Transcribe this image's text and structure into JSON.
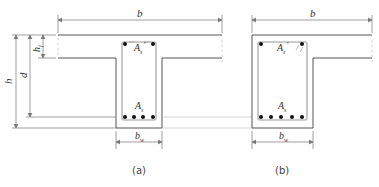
{
  "figure": {
    "colors": {
      "outline": "#555555",
      "stirrup": "#bbbbbb",
      "dimension": "#777777",
      "bar": "#111111"
    },
    "panels": [
      {
        "id": "a",
        "caption": "(a)",
        "shape": "T-beam",
        "labels": {
          "flange_width": "b",
          "web_width": "b",
          "web_width_sub": "w",
          "compression_steel": "A",
          "compression_steel_sub": "s",
          "compression_steel_prime": "'",
          "tension_steel": "A",
          "tension_steel_sub": "s"
        },
        "compression_bars": 2,
        "tension_bars": 4
      },
      {
        "id": "b",
        "caption": "(b)",
        "shape": "L-beam",
        "labels": {
          "flange_width": "b",
          "web_width": "b",
          "web_width_sub": "w",
          "compression_steel": "A",
          "compression_steel_sub": "s",
          "compression_steel_prime": "'",
          "tension_steel": "A",
          "tension_steel_sub": "s"
        },
        "compression_bars": 2,
        "tension_bars": 5
      }
    ],
    "vertical_dimensions": {
      "total_height": "h",
      "effective_depth": "d",
      "flange_thickness": "h",
      "flange_thickness_sub": "f"
    }
  }
}
